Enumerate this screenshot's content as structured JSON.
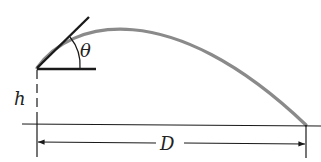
{
  "diagram": {
    "labels": {
      "angle": "θ",
      "height": "h",
      "distance": "D"
    },
    "colors": {
      "trajectory": "#8a8a8a",
      "lines": "#1a1a1a",
      "background": "#ffffff"
    }
  }
}
